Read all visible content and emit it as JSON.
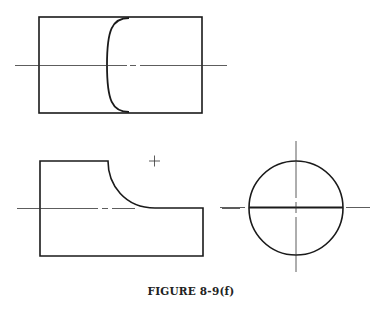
{
  "figure": {
    "caption": "FIGURE 8-9(f)",
    "colors": {
      "line": "#1a1a1a",
      "center_line": "#333333",
      "background": "#ffffff"
    },
    "views": [
      {
        "name": "top-view",
        "description": "Rectangle with curved intersection line, horizontal center line"
      },
      {
        "name": "front-view",
        "description": "Stepped profile with concave fillet arc, horizontal center line, arc center mark"
      },
      {
        "name": "side-view",
        "description": "Circle with horizontal diameter line and crossing center lines"
      }
    ]
  }
}
